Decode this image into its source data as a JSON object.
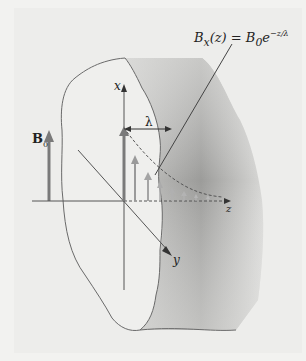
{
  "figure": {
    "formula": {
      "lhs": "B",
      "lhs_sub": "x",
      "arg": "(z) = B",
      "rhs_sub": "0",
      "rhs": "e",
      "exponent": "−z/λ"
    },
    "labels": {
      "b0": "B",
      "b0_sub": "0",
      "x_axis": "x",
      "y_axis": "y",
      "z_axis": "z",
      "lambda": "λ"
    },
    "colors": {
      "outline": "#6a6a6a",
      "arrow_dark": "#7a7a7a",
      "arrow_light": "#a8a8a8",
      "shadow_dark": "#9a9a9a",
      "surface": "#efefed"
    }
  }
}
